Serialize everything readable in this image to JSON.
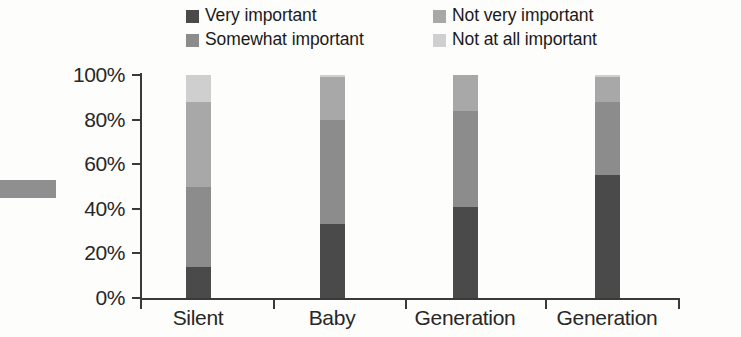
{
  "chart_data": {
    "type": "bar",
    "subtype": "stacked-bar-100-percent",
    "title": "",
    "xlabel": "",
    "ylabel": "",
    "ylim": [
      0,
      100
    ],
    "ytick_labels": [
      "0%",
      "20%",
      "40%",
      "60%",
      "80%",
      "100%"
    ],
    "ytick_values": [
      0,
      20,
      40,
      60,
      80,
      100
    ],
    "grid": false,
    "legend_position": "top",
    "categories": [
      "Silent",
      "Baby",
      "Generation",
      "Generation"
    ],
    "series": [
      {
        "name": "Very important",
        "color": "#4a4a4a",
        "values": [
          14,
          33,
          41,
          55
        ]
      },
      {
        "name": "Somewhat important",
        "color": "#8c8c8c",
        "values": [
          36,
          47,
          43,
          33
        ]
      },
      {
        "name": "Not very important",
        "color": "#a8a8a8",
        "values": [
          38,
          19,
          16,
          11
        ]
      },
      {
        "name": "Not at all important",
        "color": "#cfcfcf",
        "values": [
          12,
          1,
          0,
          1
        ]
      }
    ]
  },
  "legend": {
    "columns": [
      {
        "items": [
          {
            "label": "Very important",
            "color": "#4a4a4a",
            "swatch": "legend-swatch-very-important"
          },
          {
            "label": "Somewhat important",
            "color": "#8c8c8c",
            "swatch": "legend-swatch-somewhat-important"
          }
        ]
      },
      {
        "items": [
          {
            "label": "Not very important",
            "color": "#a8a8a8",
            "swatch": "legend-swatch-not-very-important"
          },
          {
            "label": "Not at all important",
            "color": "#cfcfcf",
            "swatch": "legend-swatch-not-at-all-important"
          }
        ]
      }
    ]
  },
  "axes": {
    "y": {
      "ticks": [
        {
          "label": "100%",
          "value": 100
        },
        {
          "label": "80%",
          "value": 80
        },
        {
          "label": "60%",
          "value": 60
        },
        {
          "label": "40%",
          "value": 40
        },
        {
          "label": "20%",
          "value": 20
        },
        {
          "label": "0%",
          "value": 0
        }
      ]
    },
    "x": {
      "ticks": [
        {
          "label": "Silent"
        },
        {
          "label": "Baby"
        },
        {
          "label": "Generation"
        },
        {
          "label": "Generation"
        }
      ]
    }
  },
  "colors": {
    "axis": "#3a3a3a",
    "text": "#272727",
    "background": "#fdfdfc",
    "artifact": "#8f8f8f"
  }
}
